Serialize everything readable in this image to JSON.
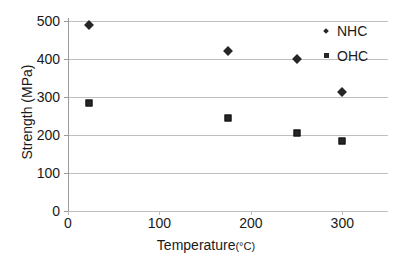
{
  "chart_data": {
    "type": "scatter",
    "title": "",
    "xlabel": "Temperature",
    "xlabel_unit": "(°C)",
    "xlabel_full": "Temperature (°C)",
    "ylabel": "Strength (MPa)",
    "xlim": [
      0,
      350
    ],
    "ylim": [
      0,
      500
    ],
    "xticks": [
      0,
      100,
      200,
      300
    ],
    "yticks": [
      0,
      100,
      200,
      300,
      400,
      500
    ],
    "xtick_labels": [
      "0",
      "100",
      "200",
      "300"
    ],
    "ytick_labels": [
      "0",
      "100",
      "200",
      "300",
      "400",
      "500"
    ],
    "grid": "horizontal",
    "legend_position": "top-right",
    "series": [
      {
        "name": "NHC",
        "marker": "diamond",
        "color": "#262626",
        "points": [
          {
            "x": 23,
            "y": 490
          },
          {
            "x": 175,
            "y": 422
          },
          {
            "x": 250,
            "y": 400
          },
          {
            "x": 300,
            "y": 313
          }
        ]
      },
      {
        "name": "OHC",
        "marker": "square",
        "color": "#262626",
        "points": [
          {
            "x": 23,
            "y": 285
          },
          {
            "x": 175,
            "y": 246
          },
          {
            "x": 250,
            "y": 206
          },
          {
            "x": 300,
            "y": 185
          }
        ]
      }
    ]
  },
  "legend": {
    "entries": [
      {
        "label": "NHC",
        "marker": "diamond"
      },
      {
        "label": "OHC",
        "marker": "square"
      }
    ]
  }
}
